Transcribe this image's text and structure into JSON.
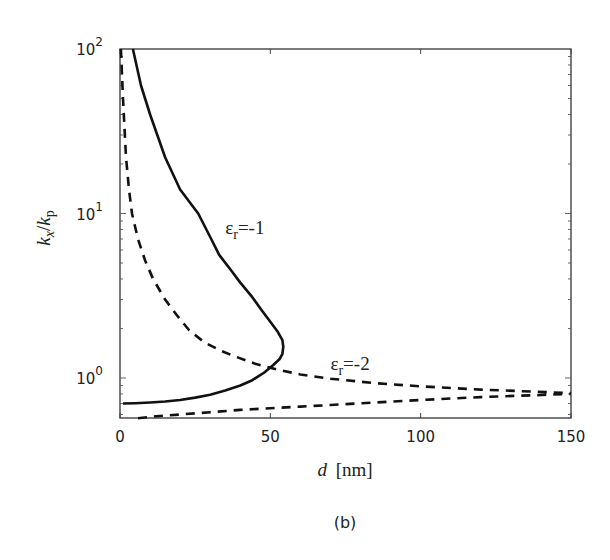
{
  "chart_data": {
    "type": "line",
    "title": "",
    "caption": "(b)",
    "xlabel": "d [nm]",
    "xlabel_parts": {
      "var": "d",
      "unit": "[nm]"
    },
    "ylabel": "kx/kp",
    "ylabel_parts": {
      "num": "k",
      "num_sub": "x",
      "den": "k",
      "den_sub": "p"
    },
    "xlim": [
      0,
      150
    ],
    "ylim": [
      0.57,
      100
    ],
    "yscale": "log",
    "grid": false,
    "x_ticks": [
      0,
      50,
      100,
      150
    ],
    "x_tick_labels": [
      "0",
      "50",
      "100",
      "150"
    ],
    "y_ticks": [
      1,
      10,
      100
    ],
    "y_tick_labels": [
      {
        "base": "10",
        "exp": "0"
      },
      {
        "base": "10",
        "exp": "1"
      },
      {
        "base": "10",
        "exp": "2"
      }
    ],
    "series": [
      {
        "name": "εr=-1",
        "label_base": "ε",
        "label_sub": "r",
        "label_value": "=-1",
        "style": "solid",
        "color": "#111111",
        "label_pos": {
          "d": 35,
          "v": 7.5
        },
        "points": [
          [
            4.3,
            100
          ],
          [
            7,
            60
          ],
          [
            10,
            40
          ],
          [
            15,
            22
          ],
          [
            20,
            14
          ],
          [
            26,
            10
          ],
          [
            30,
            7.2
          ],
          [
            33,
            5.6
          ],
          [
            37,
            4.5
          ],
          [
            40,
            3.8
          ],
          [
            44,
            3.1
          ],
          [
            47,
            2.6
          ],
          [
            50,
            2.2
          ],
          [
            52.5,
            1.9
          ],
          [
            54,
            1.7
          ],
          [
            54.3,
            1.55
          ],
          [
            54,
            1.4
          ],
          [
            53,
            1.3
          ],
          [
            51,
            1.2
          ],
          [
            48,
            1.08
          ],
          [
            44,
            0.97
          ],
          [
            40,
            0.9
          ],
          [
            35,
            0.84
          ],
          [
            30,
            0.79
          ],
          [
            25,
            0.76
          ],
          [
            20,
            0.735
          ],
          [
            15,
            0.72
          ],
          [
            10,
            0.71
          ],
          [
            5,
            0.703
          ],
          [
            1,
            0.7
          ]
        ]
      },
      {
        "name": "εr=-2",
        "label_base": "ε",
        "label_sub": "r",
        "label_value": "=-2",
        "style": "dashed",
        "color": "#111111",
        "label_pos": {
          "d": 70,
          "v": 1.12
        },
        "points": [
          [
            0.3,
            100
          ],
          [
            1,
            50
          ],
          [
            2,
            22
          ],
          [
            3,
            14
          ],
          [
            4,
            10
          ],
          [
            6,
            7
          ],
          [
            8.3,
            5.2
          ],
          [
            11,
            4.0
          ],
          [
            15,
            3.0
          ],
          [
            19,
            2.4
          ],
          [
            23,
            1.95
          ],
          [
            28,
            1.65
          ],
          [
            33,
            1.48
          ],
          [
            37,
            1.38
          ],
          [
            45,
            1.22
          ],
          [
            52,
            1.13
          ],
          [
            60,
            1.05
          ],
          [
            70,
            0.99
          ],
          [
            85,
            0.93
          ],
          [
            100,
            0.89
          ],
          [
            120,
            0.85
          ],
          [
            150,
            0.81
          ],
          null,
          [
            6,
            0.57
          ],
          [
            12,
            0.585
          ],
          [
            20,
            0.6
          ],
          [
            30,
            0.62
          ],
          [
            40,
            0.64
          ],
          [
            50,
            0.655
          ],
          [
            60,
            0.67
          ],
          [
            70,
            0.685
          ],
          [
            85,
            0.71
          ],
          [
            100,
            0.735
          ],
          [
            120,
            0.765
          ],
          [
            150,
            0.8
          ]
        ]
      }
    ]
  }
}
